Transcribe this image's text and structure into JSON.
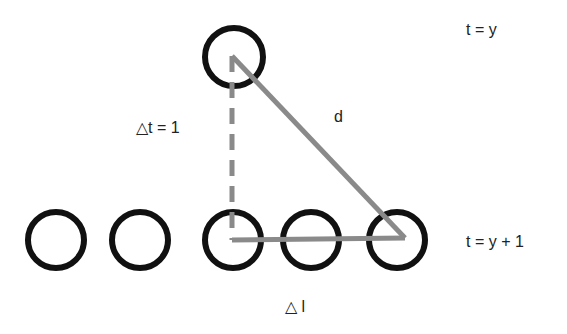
{
  "diagram": {
    "labels": {
      "top_time": "t = y",
      "bottom_time": "t = y + 1",
      "delta_t": "△t = 1",
      "distance": "d",
      "delta_l": "△ l"
    },
    "colors": {
      "circle_stroke": "#111111",
      "line": "#8a8a8a",
      "text": "#222222"
    },
    "top_circle": {
      "cx": 234,
      "cy": 57,
      "r": 29
    },
    "bottom_circles": [
      {
        "cx": 56,
        "cy": 240,
        "r": 28
      },
      {
        "cx": 140,
        "cy": 240,
        "r": 28
      },
      {
        "cx": 233,
        "cy": 240,
        "r": 28
      },
      {
        "cx": 311,
        "cy": 240,
        "r": 28
      },
      {
        "cx": 397,
        "cy": 240,
        "r": 28
      }
    ]
  }
}
